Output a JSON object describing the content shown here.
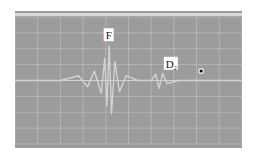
{
  "chart_data": {
    "type": "line",
    "title": "",
    "xlabel": "",
    "ylabel": "",
    "grid": true,
    "grid_divisions": {
      "x": 10,
      "y": 8
    },
    "xlim": [
      0,
      10
    ],
    "ylim": [
      -4,
      4
    ],
    "baseline": 0,
    "colors": {
      "screen": "#9c9c9c",
      "grid": "#c8c8c8",
      "trace": "#d2d2d2",
      "marker": "#111111"
    },
    "series": [
      {
        "name": "A-scan trace",
        "x": [
          0.0,
          1.0,
          2.0,
          2.8,
          3.2,
          3.5,
          3.8,
          3.95,
          4.05,
          4.15,
          4.25,
          4.4,
          4.6,
          4.9,
          5.4,
          6.0,
          6.2,
          6.35,
          6.5,
          6.7,
          7.2,
          8.0,
          9.0,
          10.0
        ],
        "y": [
          0.0,
          0.0,
          0.0,
          0.3,
          -0.4,
          0.6,
          -0.8,
          1.4,
          -1.6,
          2.2,
          -2.1,
          1.2,
          -0.7,
          0.3,
          0.0,
          0.0,
          0.4,
          -0.5,
          0.45,
          -0.2,
          0.0,
          0.0,
          0.0,
          0.0
        ]
      }
    ],
    "annotations": [
      {
        "text": "F",
        "subscript": "",
        "x": 3.95,
        "y": 2.6,
        "role": "front-surface pulse"
      },
      {
        "text": "D",
        "subscript": "2",
        "x": 6.6,
        "y": 0.8,
        "role": "defect echo"
      }
    ],
    "markers": [
      {
        "name": "gate-dot",
        "x": 8.2,
        "y": 0.6
      }
    ]
  }
}
